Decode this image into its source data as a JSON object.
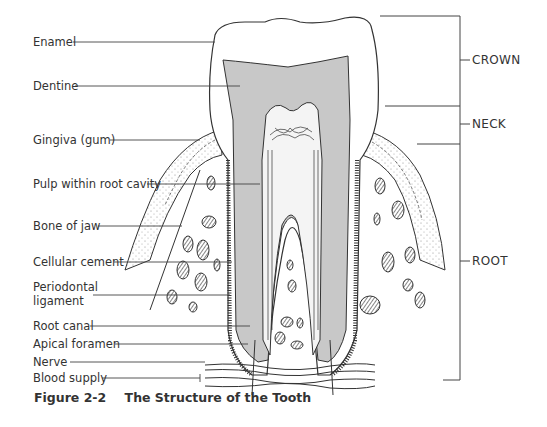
{
  "figure": {
    "number": "Figure 2-2",
    "title": "The Structure of the Tooth"
  },
  "labels_left": [
    {
      "id": "enamel",
      "text": "Enamel"
    },
    {
      "id": "dentine",
      "text": "Dentine"
    },
    {
      "id": "gingiva",
      "text": "Gingiva (gum)"
    },
    {
      "id": "pulp",
      "text": "Pulp within root cavity"
    },
    {
      "id": "bone",
      "text": "Bone of jaw"
    },
    {
      "id": "cement",
      "text": "Cellular cement"
    },
    {
      "id": "periodontal1",
      "text": "Periodontal"
    },
    {
      "id": "periodontal2",
      "text": "ligament"
    },
    {
      "id": "rootcanal",
      "text": "Root canal"
    },
    {
      "id": "apical",
      "text": "Apical foramen"
    },
    {
      "id": "nerve",
      "text": "Nerve"
    },
    {
      "id": "blood",
      "text": "Blood supply"
    }
  ],
  "labels_right": [
    {
      "id": "crown",
      "text": "CROWN"
    },
    {
      "id": "neck",
      "text": "NECK"
    },
    {
      "id": "root",
      "text": "ROOT"
    }
  ],
  "colors": {
    "dentine_fill": "#c8c8c8",
    "line": "#333333",
    "background": "#ffffff"
  }
}
